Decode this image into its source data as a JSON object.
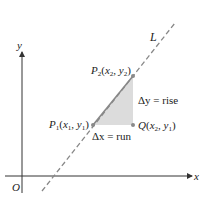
{
  "diagram": {
    "axes": {
      "x_label": "x",
      "y_label": "y",
      "origin_label": "O"
    },
    "line": {
      "label": "L",
      "style": "dashed"
    },
    "points": {
      "p1": {
        "name": "P",
        "sub": "1",
        "coords": "(x1, y1)"
      },
      "p2": {
        "name": "P",
        "sub": "2",
        "coords": "(x2, y2)"
      },
      "q": {
        "name": "Q",
        "coords": "(x2, y1)"
      }
    },
    "annotations": {
      "rise": "Δy = rise",
      "run": "Δx = run"
    },
    "colors": {
      "axis": "#333333",
      "line": "#888888",
      "triangle": "#dcdcdc",
      "point": "#8a8a8a"
    }
  }
}
